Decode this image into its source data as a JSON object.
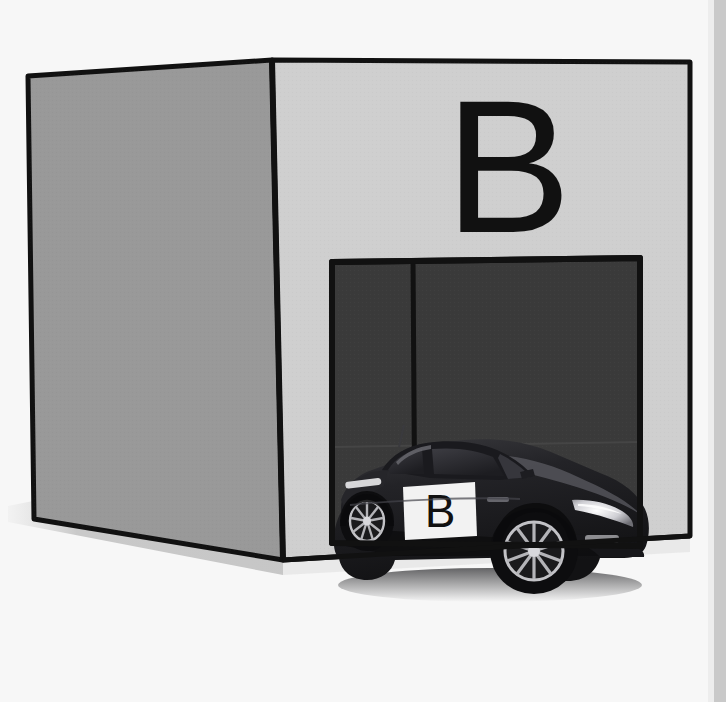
{
  "scene": {
    "title": "Garage B with parked car",
    "width": 726,
    "height": 702,
    "background_color": "#f7f7f7",
    "right_margin_color": "#c9c9c9"
  },
  "building": {
    "name": "garage",
    "label": "B",
    "side_face_color": "#999999",
    "front_face_color": "#cfcfcf",
    "outline_color": "#111111",
    "shadow_color": "#d0d0d0"
  },
  "garage_door": {
    "name": "garage-opening",
    "fill_color": "#3a3a3a",
    "outline_color": "#111111",
    "divider_color": "#111111"
  },
  "car": {
    "name": "sports-car",
    "body_color": "#1b1b1d",
    "body_highlight_color": "#4a4a4e",
    "glass_color": "#2a2a2e",
    "wheel_color": "#101012",
    "rim_color": "#b8b8bc",
    "headlight_color": "#e8e8ea",
    "door_placard_color": "#f2f2f2",
    "door_placard_label": "B",
    "shadow_color": "#2f2f31"
  }
}
